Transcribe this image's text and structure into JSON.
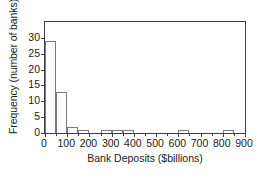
{
  "chart_data": {
    "type": "bar",
    "title": "",
    "xlabel": "Bank Deposits ($billions)",
    "ylabel": "Frequency (number of banks)",
    "xlim": [
      0,
      900
    ],
    "ylim": [
      0,
      35
    ],
    "xticks": [
      0,
      100,
      200,
      300,
      400,
      500,
      600,
      700,
      800,
      900
    ],
    "xticklabels": [
      "0",
      "100",
      "200",
      "300",
      "400",
      "500",
      "600",
      "700",
      "800",
      "900"
    ],
    "xtick_minor_step": 50,
    "yticks": [
      0,
      5,
      10,
      15,
      20,
      25,
      30
    ],
    "yticklabels": [
      "0",
      "5",
      "10",
      "15",
      "20",
      "25",
      "30"
    ],
    "grid": false,
    "legend": null,
    "bin_width": 50,
    "bins": [
      {
        "start": 0,
        "end": 50,
        "value": 29
      },
      {
        "start": 50,
        "end": 100,
        "value": 13
      },
      {
        "start": 100,
        "end": 150,
        "value": 2
      },
      {
        "start": 150,
        "end": 200,
        "value": 1
      },
      {
        "start": 200,
        "end": 250,
        "value": 0
      },
      {
        "start": 250,
        "end": 300,
        "value": 1
      },
      {
        "start": 300,
        "end": 350,
        "value": 1
      },
      {
        "start": 350,
        "end": 400,
        "value": 1
      },
      {
        "start": 400,
        "end": 450,
        "value": 0
      },
      {
        "start": 450,
        "end": 500,
        "value": 0
      },
      {
        "start": 500,
        "end": 550,
        "value": 0
      },
      {
        "start": 550,
        "end": 600,
        "value": 0
      },
      {
        "start": 600,
        "end": 650,
        "value": 1
      },
      {
        "start": 650,
        "end": 700,
        "value": 0
      },
      {
        "start": 700,
        "end": 750,
        "value": 0
      },
      {
        "start": 750,
        "end": 800,
        "value": 0
      },
      {
        "start": 800,
        "end": 850,
        "value": 1
      },
      {
        "start": 850,
        "end": 900,
        "value": 0
      }
    ],
    "colors": {
      "bar_fill": "#ffffff",
      "bar_edge": "#7a7a84",
      "frame": "#3c3c46",
      "text": "#1a1a1a",
      "background": "#ffffff"
    }
  },
  "artifact": {
    "bottom_text": ""
  }
}
